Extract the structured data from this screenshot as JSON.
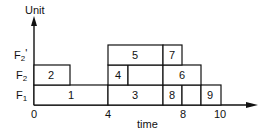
{
  "diagram": {
    "type": "gantt-schedule",
    "y_axis_label": "Unit",
    "x_axis_label": "time",
    "x_ticks": [
      "0",
      "4",
      "8",
      "10"
    ],
    "rows": [
      {
        "id": "F1",
        "label": "F",
        "sub": "1",
        "prime": ""
      },
      {
        "id": "F2",
        "label": "F",
        "sub": "2",
        "prime": ""
      },
      {
        "id": "F2p",
        "label": "F",
        "sub": "2",
        "prime": "'"
      }
    ],
    "tasks": [
      {
        "id": "1",
        "row": "F1",
        "start": 0,
        "end": 4
      },
      {
        "id": "2",
        "row": "F2",
        "start": 0,
        "end": 2
      },
      {
        "id": "3",
        "row": "F1",
        "start": 4,
        "end": 7
      },
      {
        "id": "4",
        "row": "F2",
        "start": 4,
        "end": 5
      },
      {
        "id": "5",
        "row": "F2p",
        "start": 4,
        "end": 7
      },
      {
        "id": "6",
        "row": "F2",
        "start": 7,
        "end": 9
      },
      {
        "id": "7",
        "row": "F2p",
        "start": 7,
        "end": 8
      },
      {
        "id": "8",
        "row": "F1",
        "start": 7,
        "end": 8
      },
      {
        "id": "9",
        "row": "F1",
        "start": 9,
        "end": 10
      }
    ],
    "empty_slots": [
      {
        "row": "F2",
        "start": 5,
        "end": 7
      },
      {
        "row": "F1",
        "start": 8,
        "end": 9
      }
    ],
    "colors": {
      "line": "#111111",
      "background": "#ffffff"
    }
  }
}
